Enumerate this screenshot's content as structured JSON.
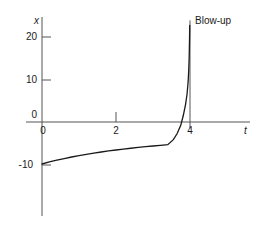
{
  "chart_data": {
    "type": "line",
    "title": "",
    "xlabel": "t",
    "ylabel": "x",
    "xlim": [
      -0.55,
      5.4
    ],
    "ylim": [
      -19.5,
      24.5
    ],
    "grid": false,
    "legend": null,
    "x_ticks": [
      {
        "value": 0,
        "label": "0"
      },
      {
        "value": 2,
        "label": "2"
      },
      {
        "value": 4,
        "label": "4"
      }
    ],
    "y_ticks": [
      {
        "value": 20,
        "label": "20"
      },
      {
        "value": 10,
        "label": "10"
      },
      {
        "value": 0,
        "label": "0"
      },
      {
        "value": -10,
        "label": "-10"
      }
    ],
    "annotations": [
      {
        "name": "blow-up",
        "text": "Blow-up",
        "x": 4.0,
        "y": 23.0
      }
    ],
    "asymptote": {
      "type": "vertical",
      "x": 4.0,
      "y_from": -1.5,
      "y_to": 24.2
    },
    "series": [
      {
        "name": "solution",
        "color": "#1a1a1a",
        "x": [
          0.0,
          0.2,
          0.4,
          0.6,
          0.8,
          1.0,
          1.2,
          1.4,
          1.6,
          1.8,
          2.0,
          2.2,
          2.4,
          2.6,
          2.8,
          3.0,
          3.2,
          3.4,
          3.55,
          3.65,
          3.75,
          3.82,
          3.88,
          3.92,
          3.95,
          3.965,
          3.975,
          3.982,
          3.988,
          3.992
        ],
        "y": [
          -10.0,
          -9.52,
          -9.09,
          -8.7,
          -8.33,
          -8.0,
          -7.69,
          -7.41,
          -7.14,
          -6.9,
          -6.67,
          -6.45,
          -6.25,
          -6.06,
          -5.88,
          -5.71,
          -5.56,
          -5.41,
          -4.2,
          -2.8,
          -0.8,
          1.6,
          4.2,
          6.6,
          9.6,
          12.2,
          14.6,
          17.2,
          20.0,
          23.0
        ],
        "note": "Solution blows up to +infinity as t approaches 4"
      }
    ]
  },
  "axes": {
    "x_axis_name": "t",
    "y_axis_name": "x"
  },
  "labels": {
    "y_20": "20",
    "y_10": "10",
    "y_0": "0",
    "y_neg10": "-10",
    "x_0": "0",
    "x_2": "2",
    "x_4": "4",
    "blow_up": "Blow-up"
  },
  "colors": {
    "curve": "#1a1a1a",
    "axis": "#555555",
    "asymptote": "#555555",
    "text": "#1a1a1a",
    "background": "#ffffff"
  }
}
